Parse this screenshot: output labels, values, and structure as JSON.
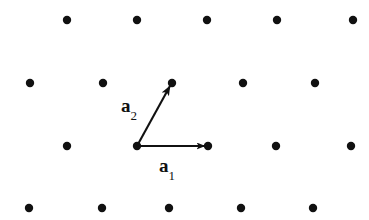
{
  "figure": {
    "background_color": "#ffffff",
    "ink_color": "#111111",
    "width": 369,
    "height": 220
  },
  "labels": {
    "a1": {
      "symbol": "a",
      "subscript": "1"
    },
    "a2": {
      "symbol": "a",
      "subscript": "2"
    }
  },
  "chart_data": {
    "type": "scatter",
    "xlabel": "",
    "ylabel": "",
    "grid": false,
    "legend": null,
    "xlim": [
      0,
      369
    ],
    "ylim": [
      220,
      0
    ],
    "point_radius": 4.2,
    "point_color": "#111111",
    "series": [
      {
        "name": "lattice-points",
        "points": [
          {
            "x": 67,
            "y": 20
          },
          {
            "x": 137,
            "y": 20
          },
          {
            "x": 207,
            "y": 20
          },
          {
            "x": 277,
            "y": 20
          },
          {
            "x": 353,
            "y": 20
          },
          {
            "x": 30,
            "y": 83
          },
          {
            "x": 103,
            "y": 83
          },
          {
            "x": 172,
            "y": 83
          },
          {
            "x": 243,
            "y": 83
          },
          {
            "x": 315,
            "y": 83
          },
          {
            "x": 67,
            "y": 146
          },
          {
            "x": 137,
            "y": 146
          },
          {
            "x": 208,
            "y": 146
          },
          {
            "x": 276,
            "y": 146
          },
          {
            "x": 351,
            "y": 146
          },
          {
            "x": 29,
            "y": 208
          },
          {
            "x": 102,
            "y": 208
          },
          {
            "x": 169,
            "y": 208
          },
          {
            "x": 241,
            "y": 208
          },
          {
            "x": 313,
            "y": 208
          }
        ]
      }
    ],
    "annotations": [
      {
        "name": "a1",
        "kind": "arrow",
        "label": "a₁",
        "from": {
          "x": 137,
          "y": 146
        },
        "to": {
          "x": 205,
          "y": 146
        },
        "label_pos": {
          "x": 159,
          "y": 156
        }
      },
      {
        "name": "a2",
        "kind": "arrow",
        "label": "a₂",
        "from": {
          "x": 137,
          "y": 146
        },
        "to": {
          "x": 170,
          "y": 86
        },
        "label_pos": {
          "x": 121,
          "y": 96
        }
      }
    ]
  }
}
